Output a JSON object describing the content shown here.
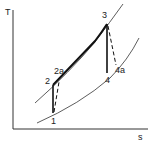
{
  "diagram": {
    "type": "T-s diagram (Brayton cycle)",
    "axes": {
      "y_label": "T",
      "x_label": "s"
    },
    "points": [
      {
        "id": "1",
        "label": "1"
      },
      {
        "id": "2",
        "label": "2"
      },
      {
        "id": "2a",
        "label": "2a"
      },
      {
        "id": "3",
        "label": "3"
      },
      {
        "id": "4",
        "label": "4"
      },
      {
        "id": "4a",
        "label": "4a"
      }
    ],
    "curves": [
      {
        "name": "high-pressure-isobar",
        "style": "thin"
      },
      {
        "name": "low-pressure-isobar",
        "style": "thin"
      }
    ],
    "processes": [
      {
        "from": "1",
        "to": "2",
        "style": "solid"
      },
      {
        "from": "1",
        "to": "2a",
        "style": "dashed"
      },
      {
        "from": "2",
        "to": "3",
        "style": "solid-thick"
      },
      {
        "from": "3",
        "to": "4",
        "style": "solid"
      },
      {
        "from": "3",
        "to": "4a",
        "style": "dashed"
      }
    ],
    "colors": {
      "line": "#222222",
      "background": "#ffffff"
    }
  }
}
